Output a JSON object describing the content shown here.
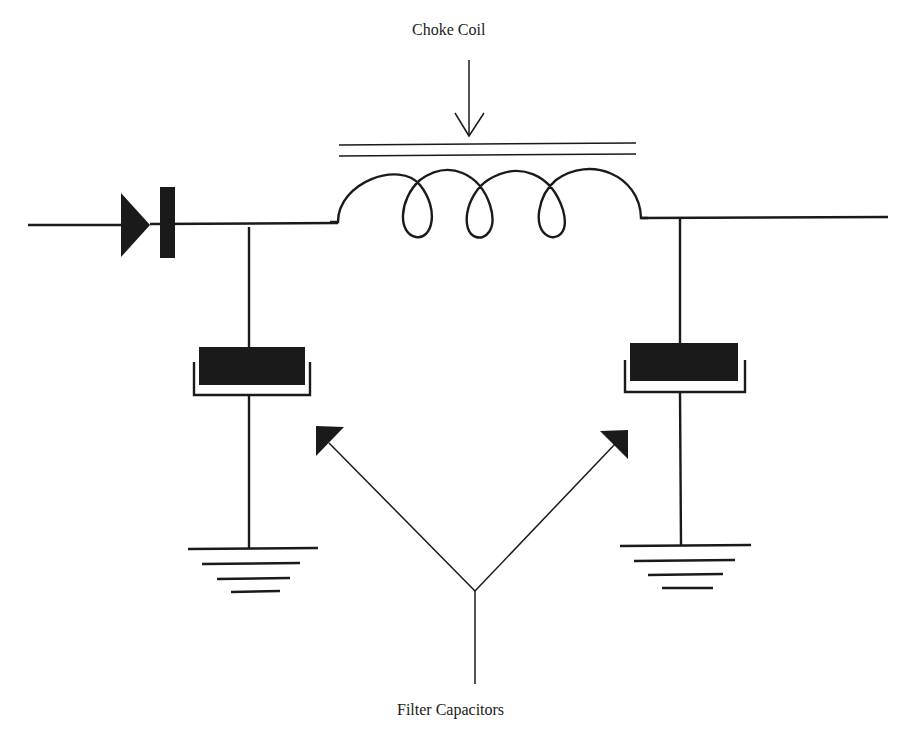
{
  "diagram": {
    "labels": {
      "choke_coil": "Choke Coil",
      "filter_capacitors": "Filter Capacitors"
    },
    "components": [
      {
        "type": "diode",
        "name": "rectifier-diode"
      },
      {
        "type": "inductor",
        "name": "choke-coil",
        "turns": 4,
        "core": "iron (two parallel lines)"
      },
      {
        "type": "capacitor",
        "name": "filter-capacitor-input"
      },
      {
        "type": "capacitor",
        "name": "filter-capacitor-output"
      },
      {
        "type": "ground",
        "name": "ground-left"
      },
      {
        "type": "ground",
        "name": "ground-right"
      }
    ],
    "colors": {
      "ink": "#1a1a1a",
      "background": "#ffffff"
    }
  }
}
